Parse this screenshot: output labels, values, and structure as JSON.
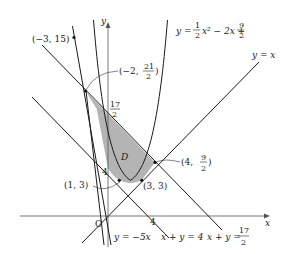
{
  "figure": {
    "axes": {
      "x_label": "x",
      "y_label": "y",
      "origin_label": "O",
      "x_tick_4": "4",
      "y_tick_4": "4",
      "y_tick_17_2": {
        "num": "17",
        "den": "2"
      }
    },
    "region_label": "D",
    "curves": {
      "parabola": {
        "prefix": "y =",
        "a_num": "1",
        "a_den": "2",
        "mid": "x² − 2x +",
        "c_num": "9",
        "c_den": "2"
      },
      "line_y_eq_x": "y = x",
      "line_y_eq_m5x": "y = −5x",
      "line_x_plus_y_4": "x + y = 4",
      "line_x_plus_y_17_2": {
        "prefix": "x + y =",
        "num": "17",
        "den": "2"
      }
    },
    "points": {
      "p_m3_15": "(−3,  15)",
      "p_m2_21_2": {
        "open": "(−2,",
        "num": "21",
        "den": "2",
        "close": ")"
      },
      "p_1_3": "(1,  3)",
      "p_3_3": "(3,  3)",
      "p_4_9_2": {
        "open": "(4,",
        "num": "9",
        "den": "2",
        "close": ")"
      }
    },
    "colors": {
      "region_fill": "#b4b4b4",
      "stroke": "#1a1a1a"
    }
  }
}
